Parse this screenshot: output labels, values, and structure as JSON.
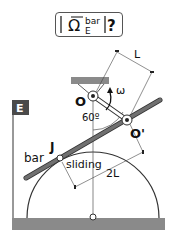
{
  "title": {
    "symbol": "Ω",
    "superscript": "bar",
    "subscript": "E",
    "question": "?"
  },
  "labels": {
    "frame": "E",
    "pivot_fixed": "O",
    "pivot_moving": "O'",
    "angle": "60º",
    "omega": "ω",
    "bar": "bar",
    "contact_point": "J",
    "contact_type": "sliding",
    "dim_short": "L",
    "dim_long": "2L"
  },
  "colors": {
    "ground": "#8a8a8a",
    "bar": "#707070",
    "frame_label_bg": "#4a4a4a",
    "line": "#333333"
  }
}
